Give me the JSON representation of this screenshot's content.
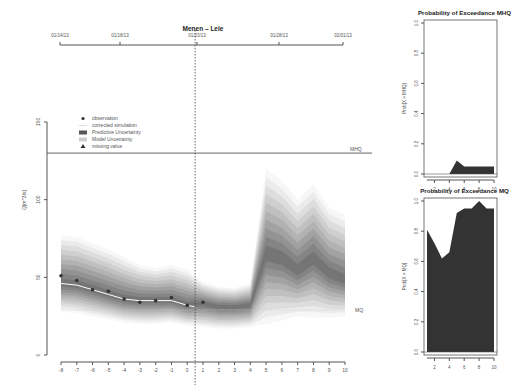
{
  "chart_data": [
    {
      "type": "area",
      "title": "Menen – Leie",
      "xlabel": "",
      "ylabel": "Q[m^3/s]",
      "ylim": [
        0,
        150
      ],
      "xlim": [
        -8,
        10
      ],
      "x_ticks": [
        "-8",
        "-7",
        "-6",
        "-5",
        "-4",
        "-3",
        "-2",
        "-1",
        "0",
        "1",
        "2",
        "3",
        "4",
        "5",
        "6",
        "7",
        "8",
        "9",
        "10"
      ],
      "y_ticks": [
        "0",
        "50",
        "100",
        "150"
      ],
      "top_axis_dates": [
        "01/14/13",
        "01/18/13",
        "01/23/13",
        "01/28/13",
        "02/01/13"
      ],
      "forecast_start_marker": "vertical dashed line at x≈0.5",
      "thresholds": [
        {
          "name": "MHQ",
          "value": 130
        },
        {
          "name": "MQ",
          "value": 29
        }
      ],
      "legend": {
        "position": "top-left",
        "entries": [
          {
            "symbol": "circle",
            "label": "observation"
          },
          {
            "symbol": "line",
            "label": "corrected simulation"
          },
          {
            "symbol": "dark-box",
            "label": "Predictive Uncertainty"
          },
          {
            "symbol": "light-box",
            "label": "Model Uncertainty"
          },
          {
            "symbol": "triangle",
            "label": "missing value"
          }
        ]
      },
      "series": [
        {
          "name": "observation",
          "x": [
            -8,
            -7,
            -6,
            -5,
            -4,
            -3,
            -2,
            -1,
            0,
            1
          ],
          "values": [
            51,
            48,
            42,
            41,
            36,
            34,
            35,
            37,
            32,
            34
          ]
        },
        {
          "name": "corrected simulation",
          "x": [
            -8,
            -7,
            -6,
            -5,
            -4,
            -3,
            -2,
            -1,
            0,
            0.5
          ],
          "values": [
            46,
            45,
            42,
            39,
            36,
            35,
            35,
            35,
            32,
            31
          ]
        },
        {
          "name": "forecast median",
          "x": [
            1,
            2,
            3,
            4,
            5,
            6,
            7,
            8,
            9,
            10
          ],
          "values": [
            33,
            31,
            31,
            32,
            65,
            62,
            54,
            62,
            52,
            48
          ]
        },
        {
          "name": "uncertainty upper (outer)",
          "x": [
            -8,
            -7,
            -6,
            -5,
            -4,
            -3,
            -2,
            -1,
            0,
            1,
            2,
            3,
            4,
            5,
            6,
            7,
            8,
            9,
            10
          ],
          "values": [
            77,
            76,
            72,
            68,
            63,
            58,
            56,
            58,
            55,
            47,
            44,
            43,
            46,
            120,
            112,
            100,
            110,
            95,
            90
          ]
        },
        {
          "name": "uncertainty lower (outer)",
          "x": [
            -8,
            -7,
            -6,
            -5,
            -4,
            -3,
            -2,
            -1,
            0,
            1,
            2,
            3,
            4,
            5,
            6,
            7,
            8,
            9,
            10
          ],
          "values": [
            28,
            27,
            25,
            23,
            21,
            20,
            20,
            21,
            19,
            18,
            17,
            17,
            18,
            20,
            22,
            25,
            24,
            24,
            25
          ]
        }
      ]
    },
    {
      "type": "area",
      "title": "Probability of Exceedance MHQ",
      "ylabel": "Prob[X > MHQ]",
      "ylim": [
        0,
        1
      ],
      "x_ticks": [
        "2",
        "4",
        "6",
        "8",
        "10"
      ],
      "y_ticks": [
        "0.0",
        "0.2",
        "0.4",
        "0.6",
        "0.8",
        "1.0"
      ],
      "x": [
        1,
        2,
        3,
        4,
        5,
        6,
        7,
        8,
        9,
        10
      ],
      "values": [
        0,
        0,
        0,
        0,
        0.09,
        0.05,
        0.05,
        0.05,
        0.05,
        0.05
      ]
    },
    {
      "type": "area",
      "title": "Probability of Exceedance MQ",
      "ylabel": "Prob[X > MQ]",
      "ylim": [
        0,
        1
      ],
      "x_ticks": [
        "2",
        "4",
        "6",
        "8",
        "10"
      ],
      "y_ticks": [
        "0.0",
        "0.2",
        "0.4",
        "0.6",
        "0.8",
        "1.0"
      ],
      "x": [
        1,
        2,
        3,
        4,
        5,
        6,
        7,
        8,
        9,
        10
      ],
      "values": [
        0.81,
        0.72,
        0.62,
        0.66,
        0.92,
        0.95,
        0.95,
        1.0,
        0.95,
        0.95
      ]
    }
  ],
  "colors": {
    "axis": "#555555",
    "fill_dark": "#333333",
    "threshold": "#666666"
  }
}
